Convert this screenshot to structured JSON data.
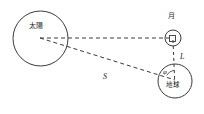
{
  "figure": {
    "background_color": "#ffffff",
    "stroke_color": "#3a3a3a",
    "width": 204,
    "height": 114
  },
  "bodies": {
    "sun": {
      "label": "太陽",
      "cx": 40.5,
      "cy": 38.5,
      "r": 27.5
    },
    "moon": {
      "label": "月",
      "cx": 173,
      "cy": 38,
      "r": 8,
      "marker": "right-angle-square"
    },
    "earth": {
      "label": "地球",
      "cx": 175,
      "cy": 81,
      "r": 17
    }
  },
  "measures": {
    "sun_distance_label": "S",
    "moon_distance_label": "L",
    "angle_label": "φ"
  },
  "lines": {
    "sun_to_moon": "dashed",
    "sun_to_earth": "dashed",
    "moon_to_earth": "dashed",
    "angle_arc": "solid"
  }
}
